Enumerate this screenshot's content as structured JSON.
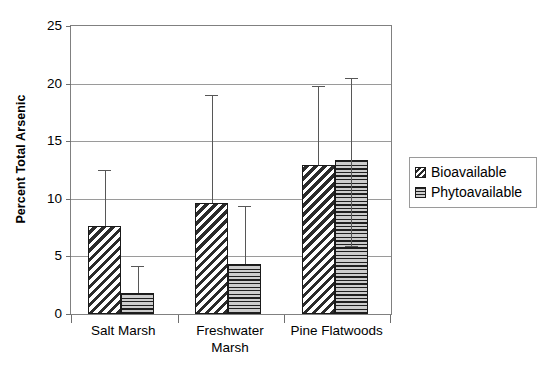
{
  "chart_data": {
    "type": "bar",
    "title": "",
    "xlabel": "",
    "ylabel": "Percent Total Arsenic",
    "ylim": [
      0,
      25
    ],
    "yticks": [
      0,
      5,
      10,
      15,
      20,
      25
    ],
    "ytick_labels": [
      "0",
      "5",
      "10",
      "15",
      "20",
      "25"
    ],
    "grid": true,
    "legend_position": "right",
    "categories": [
      "Salt Marsh",
      "Freshwater Marsh",
      "Pine Flatwoods"
    ],
    "category_label_lines": [
      [
        "Salt Marsh"
      ],
      [
        "Freshwater",
        "Marsh"
      ],
      [
        "Pine Flatwoods"
      ]
    ],
    "series": [
      {
        "name": "Bioavailable",
        "pattern": "diagonal-hatch",
        "values": [
          7.6,
          9.6,
          12.9
        ],
        "error_upper": [
          12.5,
          19.0,
          19.8
        ],
        "error_lower": [
          7.6,
          9.6,
          12.9
        ]
      },
      {
        "name": "Phytoavailable",
        "pattern": "horizontal-hatch",
        "values": [
          1.8,
          4.3,
          13.4
        ],
        "error_upper": [
          4.2,
          9.4,
          20.5
        ],
        "error_lower": [
          1.8,
          4.3,
          5.9
        ]
      }
    ],
    "legend": [
      "Bioavailable",
      "Phytoavailable"
    ],
    "colors": {
      "bar_outline": "#1a1a1a",
      "hatch": "#2b2b2b",
      "phyto_fill": "#c8c8c8",
      "gridline": "#9a9a9a",
      "axis": "#808080",
      "error_bar": "#575757",
      "background": "#ffffff"
    }
  }
}
